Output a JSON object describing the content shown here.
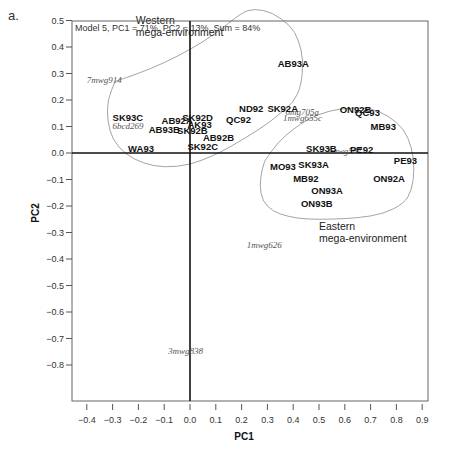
{
  "panel_label": "a.",
  "chart_data": {
    "type": "scatter",
    "title": "Model 5, PC1 = 71%, PC2 = 13%, Sum = 84%",
    "xlabel": "PC1",
    "ylabel": "PC2",
    "xlim": [
      -0.45,
      0.92
    ],
    "ylim": [
      -0.83,
      0.6
    ],
    "xticks": [
      -0.4,
      -0.3,
      -0.2,
      -0.1,
      0.0,
      0.1,
      0.2,
      0.3,
      0.4,
      0.5,
      0.6,
      0.7,
      0.8,
      0.9
    ],
    "xtick_labels": [
      "−0.4",
      "−0.3",
      "−0.2",
      "−0.1",
      "0.0",
      "0.1",
      "0.2",
      "0.3",
      "0.4",
      "0.5",
      "0.6",
      "0.7",
      "0.8",
      "0.9"
    ],
    "yticks": [
      0.6,
      0.5,
      0.4,
      0.3,
      0.2,
      0.1,
      0.0,
      -0.1,
      -0.2,
      -0.3,
      -0.4,
      -0.5,
      -0.6,
      -0.7,
      -0.8
    ],
    "ytick_labels": [
      "0.6",
      "0.5",
      "0.4",
      "0.3",
      "0.2",
      "0.1",
      "0.0",
      "−0.1",
      "−0.2",
      "−0.3",
      "−0.4",
      "−0.5",
      "−0.6",
      "−0.7",
      "−0.8"
    ],
    "grid": false,
    "genotypes": [
      {
        "label": "AB93A",
        "x": 0.34,
        "y": 0.325
      },
      {
        "label": "ND92",
        "x": 0.19,
        "y": 0.155
      },
      {
        "label": "SK92A",
        "x": 0.3,
        "y": 0.155
      },
      {
        "label": "QC92",
        "x": 0.14,
        "y": 0.115
      },
      {
        "label": "SK93C",
        "x": -0.3,
        "y": 0.12
      },
      {
        "label": "AB92A",
        "x": -0.11,
        "y": 0.11
      },
      {
        "label": "SK92D",
        "x": -0.03,
        "y": 0.12
      },
      {
        "label": "AK93",
        "x": -0.01,
        "y": 0.095
      },
      {
        "label": "AB93B",
        "x": -0.16,
        "y": 0.075
      },
      {
        "label": "SK92B",
        "x": -0.05,
        "y": 0.07
      },
      {
        "label": "AB92B",
        "x": 0.05,
        "y": 0.045
      },
      {
        "label": "SK92C",
        "x": -0.01,
        "y": 0.01
      },
      {
        "label": "WA93",
        "x": -0.24,
        "y": 0.005
      },
      {
        "label": "ON92B",
        "x": 0.58,
        "y": 0.15
      },
      {
        "label": "QC93",
        "x": 0.64,
        "y": 0.14
      },
      {
        "label": "MB93",
        "x": 0.7,
        "y": 0.085
      },
      {
        "label": "SK93B",
        "x": 0.45,
        "y": 0.005
      },
      {
        "label": "PE92",
        "x": 0.62,
        "y": 0.0
      },
      {
        "label": "PE93",
        "x": 0.79,
        "y": -0.04
      },
      {
        "label": "MO93",
        "x": 0.31,
        "y": -0.065
      },
      {
        "label": "SK93A",
        "x": 0.42,
        "y": -0.055
      },
      {
        "label": "MB92",
        "x": 0.4,
        "y": -0.11
      },
      {
        "label": "ON92A",
        "x": 0.71,
        "y": -0.11
      },
      {
        "label": "ON93A",
        "x": 0.47,
        "y": -0.155
      },
      {
        "label": "ON93B",
        "x": 0.43,
        "y": -0.205
      }
    ],
    "environments": [
      {
        "label": "7mwg914",
        "x": -0.4,
        "y": 0.265
      },
      {
        "label": "6bcd269",
        "x": -0.3,
        "y": 0.09
      },
      {
        "label": "6mg705a",
        "x": 0.37,
        "y": 0.145
      },
      {
        "label": "1mwg655c",
        "x": 0.36,
        "y": 0.12
      },
      {
        "label": "1mwg587",
        "x": 0.53,
        "y": -0.005
      },
      {
        "label": "1mwg626",
        "x": 0.22,
        "y": -0.36
      },
      {
        "label": "3mwg838",
        "x": -0.085,
        "y": -0.76
      }
    ],
    "regions": [
      {
        "label_lines": [
          "Western",
          "mega-environment"
        ],
        "label_x": -0.21,
        "label_y": 0.485,
        "outline": [
          [
            -0.29,
            0.27
          ],
          [
            -0.2,
            0.3
          ],
          [
            -0.1,
            0.34
          ],
          [
            0.0,
            0.39
          ],
          [
            0.1,
            0.45
          ],
          [
            0.2,
            0.53
          ],
          [
            0.25,
            0.545
          ],
          [
            0.32,
            0.53
          ],
          [
            0.39,
            0.48
          ],
          [
            0.42,
            0.43
          ],
          [
            0.44,
            0.35
          ],
          [
            0.43,
            0.25
          ],
          [
            0.4,
            0.19
          ],
          [
            0.35,
            0.15
          ],
          [
            0.3,
            0.11
          ],
          [
            0.22,
            0.06
          ],
          [
            0.15,
            0.02
          ],
          [
            0.09,
            -0.01
          ],
          [
            0.0,
            -0.045
          ],
          [
            -0.1,
            -0.055
          ],
          [
            -0.18,
            -0.04
          ],
          [
            -0.25,
            -0.005
          ],
          [
            -0.3,
            0.05
          ],
          [
            -0.32,
            0.12
          ],
          [
            -0.32,
            0.2
          ],
          [
            -0.29,
            0.27
          ]
        ]
      },
      {
        "label_lines": [
          "Eastern",
          "mega-environment"
        ],
        "label_x": 0.5,
        "label_y": -0.29,
        "outline": [
          [
            0.29,
            -0.03
          ],
          [
            0.34,
            0.04
          ],
          [
            0.4,
            0.09
          ],
          [
            0.46,
            0.13
          ],
          [
            0.54,
            0.16
          ],
          [
            0.62,
            0.17
          ],
          [
            0.7,
            0.17
          ],
          [
            0.77,
            0.14
          ],
          [
            0.83,
            0.09
          ],
          [
            0.86,
            0.02
          ],
          [
            0.87,
            -0.06
          ],
          [
            0.86,
            -0.14
          ],
          [
            0.83,
            -0.19
          ],
          [
            0.75,
            -0.23
          ],
          [
            0.65,
            -0.245
          ],
          [
            0.55,
            -0.25
          ],
          [
            0.45,
            -0.25
          ],
          [
            0.38,
            -0.24
          ],
          [
            0.32,
            -0.22
          ],
          [
            0.28,
            -0.18
          ],
          [
            0.27,
            -0.12
          ],
          [
            0.28,
            -0.06
          ],
          [
            0.29,
            -0.03
          ]
        ]
      }
    ]
  }
}
